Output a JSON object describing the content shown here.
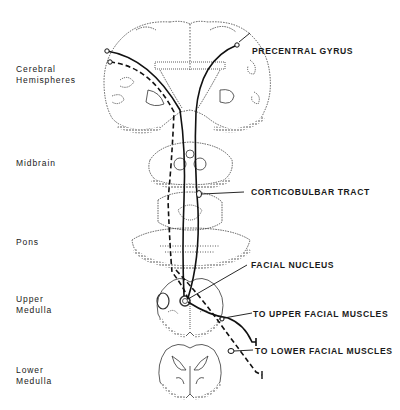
{
  "diagram": {
    "left_labels": [
      {
        "id": "cerebral",
        "text": "Cerebral\nHemispheres"
      },
      {
        "id": "midbrain",
        "text": "Midbrain"
      },
      {
        "id": "pons",
        "text": "Pons"
      },
      {
        "id": "upper_medulla",
        "text": "Upper\nMedulla"
      },
      {
        "id": "lower_medulla",
        "text": "Lower\nMedulla"
      }
    ],
    "callouts": [
      {
        "id": "precentral",
        "text": "PRECENTRAL  GYRUS"
      },
      {
        "id": "corticobulbar",
        "text": "CORTICOBULBAR TRACT"
      },
      {
        "id": "facial_nucleus",
        "text": "FACIAL  NUCLEUS"
      },
      {
        "id": "upper_muscles",
        "text": "TO UPPER FACIAL MUSCLES"
      },
      {
        "id": "lower_muscles",
        "text": "TO LOWER  FACIAL MUSCLES"
      }
    ],
    "legend": {
      "solid_line": "pathway to upper face (bilateral)",
      "dashed_line": "pathway to lower face (contralateral)"
    },
    "colors": {
      "ink": "#1a1a1a",
      "background": "#ffffff",
      "stipple": "#555555"
    }
  }
}
